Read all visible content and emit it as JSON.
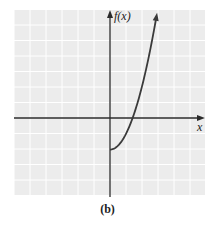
{
  "chart_data": {
    "type": "line",
    "title": "",
    "caption": "(b)",
    "xlabel": "x",
    "ylabel": "f(x)",
    "grid": true,
    "xlim": [
      -6,
      6
    ],
    "ylim": [
      -5,
      7
    ],
    "series": [
      {
        "name": "f(x)",
        "description": "half-parabola starting at (0,-2), increasing for x >= 0, arrow at top",
        "x": [
          0,
          0.5,
          1,
          1.41,
          1.5,
          2,
          2.5,
          2.9
        ],
        "y": [
          -2,
          -1.75,
          -1,
          0,
          0.25,
          2,
          4.25,
          6.4
        ]
      }
    ],
    "annotations": [
      {
        "type": "arrow",
        "at": "curve-end-top"
      },
      {
        "type": "arrow",
        "at": "y-axis-top"
      },
      {
        "type": "arrow",
        "at": "x-axis-right"
      }
    ]
  },
  "labels": {
    "y_axis": "f(x)",
    "x_axis": "x",
    "caption": "(b)"
  },
  "colors": {
    "grid_bg": "#ececec",
    "grid_line": "#ffffff",
    "axis": "#2a2a2a",
    "curve": "#3a3a3a"
  }
}
